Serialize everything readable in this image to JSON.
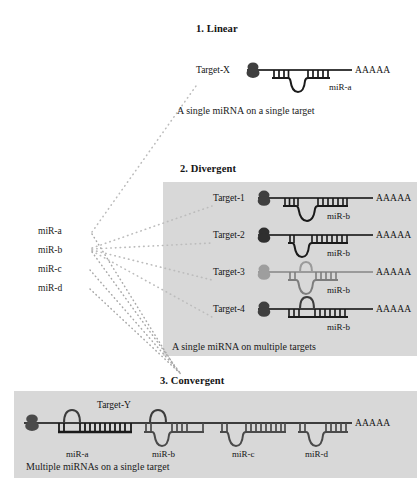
{
  "figure": {
    "sections": [
      {
        "id": "linear",
        "title": "1. Linear",
        "caption": "A single miRNA on a single target",
        "panel_shaded": false,
        "rows": [
          {
            "target": "Target-X",
            "mirna": "miR-a",
            "polyA": "AAAAA",
            "target_dim": false
          }
        ]
      },
      {
        "id": "divergent",
        "title": "2. Divergent",
        "caption": "A single miRNA on multiple targets",
        "panel_shaded": true,
        "rows": [
          {
            "target": "Target-1",
            "mirna": "miR-b",
            "polyA": "AAAAA",
            "target_dim": false
          },
          {
            "target": "Target-2",
            "mirna": "miR-b",
            "polyA": "AAAAA",
            "target_dim": false
          },
          {
            "target": "Target-3",
            "mirna": "miR-b",
            "polyA": "AAAAA",
            "target_dim": true
          },
          {
            "target": "Target-4",
            "mirna": "miR-b",
            "polyA": "AAAAA",
            "target_dim": false
          }
        ]
      },
      {
        "id": "convergent",
        "title": "3. Convergent",
        "caption": "Multiple miRNAs on a single target",
        "panel_shaded": true,
        "target_label": "Target-Y",
        "polyA": "AAAAA",
        "mirnas": [
          "miR-a",
          "miR-b",
          "miR-c",
          "miR-d"
        ]
      }
    ],
    "source_mirnas": [
      "miR-a",
      "miR-b",
      "miR-c",
      "miR-d"
    ],
    "colors": {
      "panel": "#d8d8d8",
      "transcript": "#3c3c3c",
      "transcript_dim": "#9a9a9a",
      "duplex_dark": "#1a1a1a",
      "duplex_mid": "#555555",
      "duplex_dim": "#9a9a9a",
      "protein": "#4a4a4a",
      "protein_dim": "#9e9e9e",
      "connector": "#b4b4b4",
      "text": "#1a1a1a"
    }
  }
}
